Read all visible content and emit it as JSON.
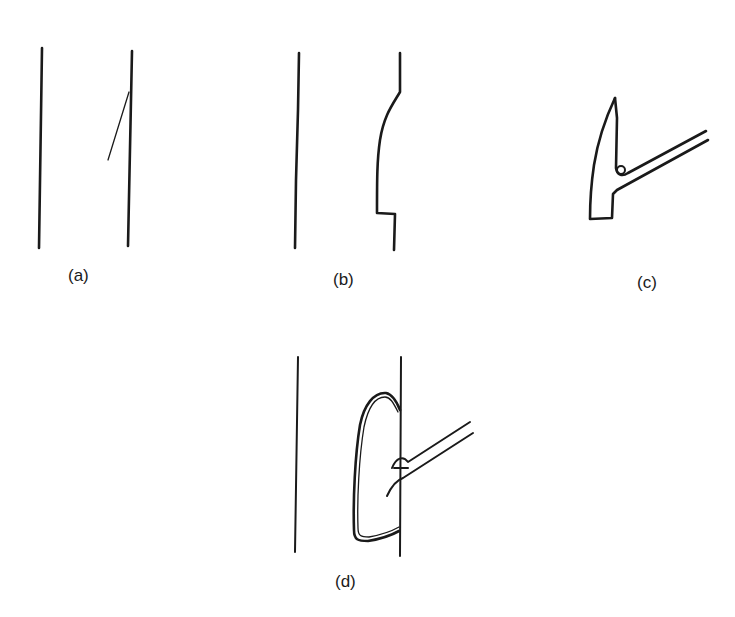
{
  "panels": {
    "a": {
      "label": "(a)"
    },
    "b": {
      "label": "(b)"
    },
    "c": {
      "label": "(c)"
    },
    "d": {
      "label": "(d)"
    }
  },
  "colors": {
    "ink": "#1a1a1a",
    "background": "#ffffff"
  }
}
